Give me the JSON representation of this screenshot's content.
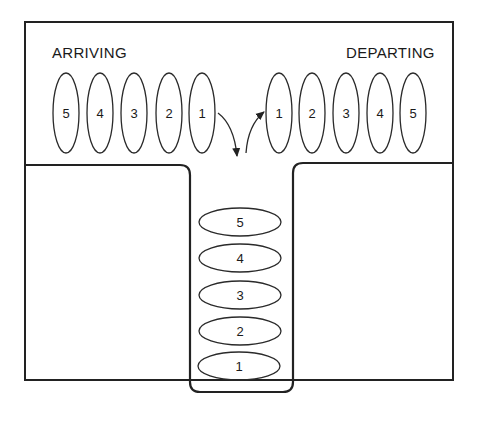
{
  "diagram": {
    "labels": {
      "arriving": "ARRIVING",
      "departing": "DEPARTING"
    },
    "arriving_items": [
      "5",
      "4",
      "3",
      "2",
      "1"
    ],
    "departing_items": [
      "1",
      "2",
      "3",
      "4",
      "5"
    ],
    "stack_items_top_to_bottom": [
      "5",
      "4",
      "3",
      "2",
      "1"
    ],
    "arrows": [
      {
        "name": "push-arrow",
        "from": "arriving item 1",
        "to": "stack",
        "direction": "down"
      },
      {
        "name": "pop-arrow",
        "from": "stack",
        "to": "departing item 1",
        "direction": "up"
      }
    ],
    "colors": {
      "line": "#222222",
      "background": "#ffffff"
    }
  }
}
